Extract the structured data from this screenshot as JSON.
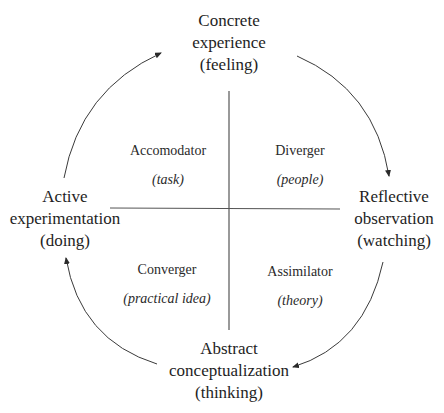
{
  "diagram": {
    "nodes": {
      "top": {
        "lines": [
          "Concrete",
          "experience",
          "(feeling)"
        ]
      },
      "right": {
        "lines": [
          "Reflective",
          "observation",
          "(watching)"
        ]
      },
      "bottom": {
        "lines": [
          "Abstract",
          "conceptualization",
          "(thinking)"
        ]
      },
      "left": {
        "lines": [
          "Active",
          "experimentation",
          "(doing)"
        ]
      }
    },
    "quadrants": {
      "top_left": {
        "name": "Accomodator",
        "sub": "(task)"
      },
      "top_right": {
        "name": "Diverger",
        "sub": "(people)"
      },
      "bottom_left": {
        "name": "Converger",
        "sub": "(practical idea)"
      },
      "bottom_right": {
        "name": "Assimilator",
        "sub": "(theory)"
      }
    },
    "cycle_direction": "clockwise",
    "colors": {
      "line": "#3a3a3a",
      "text": "#1e1e1e",
      "background": "#ffffff"
    }
  }
}
